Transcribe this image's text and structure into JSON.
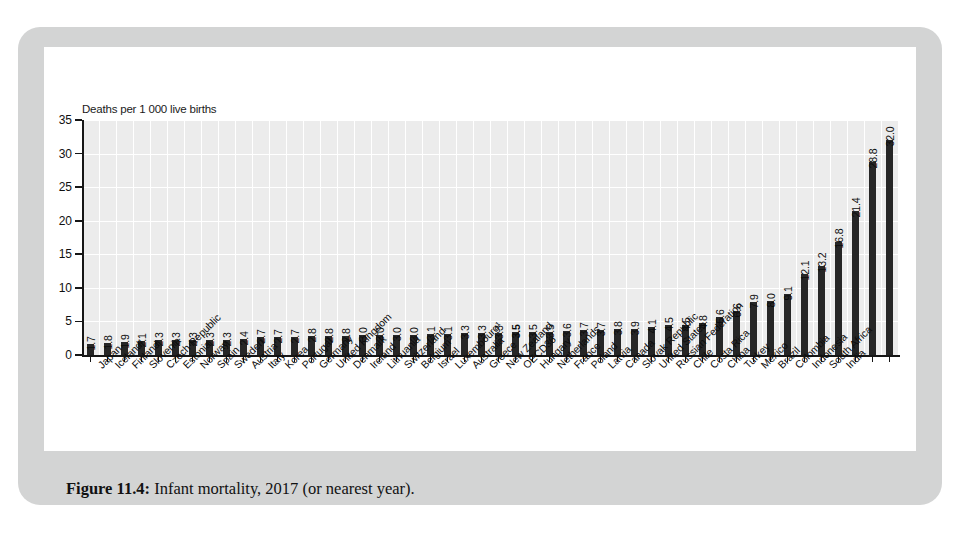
{
  "caption": {
    "label": "Figure 11.4:",
    "text": " Infant mortality, 2017 (or nearest year)."
  },
  "chart_data": {
    "type": "bar",
    "title": "Infant mortality, 2017 (or nearest year)",
    "ylabel": "Deaths per 1 000 live births",
    "xlabel": "",
    "ylim": [
      0,
      35
    ],
    "yticks": [
      0,
      5,
      10,
      15,
      20,
      25,
      30,
      35
    ],
    "grid": true,
    "legend": "none",
    "bar_color": "#262626",
    "plot_background": "#ececec",
    "highlight_category": "OECD36",
    "categories": [
      "Japan",
      "Iceland¹",
      "Finland",
      "Slovenia",
      "Czech Republic",
      "Estonia",
      "Norway",
      "Spain",
      "Sweden",
      "Austria",
      "Italy",
      "Korea",
      "Portugal",
      "Germany",
      "United Kingdom",
      "Denmark",
      "Ireland",
      "Lithuania",
      "Switzerland",
      "Belgium",
      "Israel",
      "Luxembourg¹",
      "Australia",
      "Greece",
      "New Zealand",
      "OECD36",
      "Hungary",
      "Netherlands",
      "France",
      "Poland",
      "Latvia",
      "Canada",
      "Slovak Republic",
      "United States",
      "Russian Federation",
      "Chile",
      "Costa Rica",
      "China",
      "Turkey",
      "Mexico",
      "Brazil",
      "Colombia",
      "Indonesia",
      "South Africa",
      "India"
    ],
    "values": [
      1.7,
      1.8,
      1.9,
      2.1,
      2.3,
      2.3,
      2.3,
      2.3,
      2.3,
      2.4,
      2.7,
      2.7,
      2.7,
      2.8,
      2.8,
      2.8,
      3.0,
      3.0,
      3.0,
      3.0,
      3.1,
      3.1,
      3.3,
      3.3,
      3.3,
      3.5,
      3.5,
      3.5,
      3.6,
      3.7,
      3.7,
      3.8,
      3.9,
      4.1,
      4.5,
      4.5,
      4.8,
      5.6,
      6.6,
      7.9,
      8.0,
      9.1,
      12.1,
      13.2,
      16.8
    ],
    "value_labels": [
      "1.7",
      "1.8",
      "1.9",
      "2.1",
      "2.3",
      "2.3",
      "2.3",
      "2.3",
      "2.3",
      "2.4",
      "2.7",
      "2.7",
      "2.7",
      "2.8",
      "2.8",
      "2.8",
      "3.0",
      "3.0",
      "3.0",
      "3.0",
      "3.1",
      "3.1",
      "3.3",
      "3.3",
      "3.3",
      "3.5",
      "3.5",
      "3.5",
      "3.6",
      "3.7",
      "3.7",
      "3.8",
      "3.9",
      "4.1",
      "4.5",
      "4.5",
      "4.8",
      "5.6",
      "6.6",
      "7.9",
      "8.0",
      "9.1",
      "12.1",
      "13.2",
      "16.8"
    ]
  },
  "chart_full": {
    "categories": [
      "Japan",
      "Iceland¹",
      "Finland",
      "Slovenia",
      "Czech Republic",
      "Estonia",
      "Norway",
      "Spain",
      "Sweden",
      "Austria",
      "Italy",
      "Korea",
      "Portugal",
      "Germany",
      "United Kingdom",
      "Denmark",
      "Ireland",
      "Lithuania",
      "Switzerland",
      "Belgium",
      "Israel",
      "Luxembourg¹",
      "Australia",
      "Greece",
      "New Zealand",
      "OECD36",
      "Hungary",
      "Netherlands",
      "France",
      "Poland",
      "Latvia",
      "Canada",
      "Slovak Republic",
      "United States",
      "Russian Federation",
      "Chile",
      "Costa Rica",
      "China",
      "Turkey",
      "Mexico",
      "Brazil",
      "Colombia",
      "Indonesia",
      "South Africa",
      "India"
    ],
    "values": [
      1.7,
      1.8,
      1.9,
      2.1,
      2.3,
      2.3,
      2.3,
      2.3,
      2.3,
      2.4,
      2.7,
      2.7,
      2.7,
      2.8,
      2.8,
      2.8,
      3.0,
      3.0,
      3.0,
      3.0,
      3.1,
      3.1,
      3.3,
      3.3,
      3.3,
      3.5,
      3.5,
      3.5,
      3.6,
      3.7,
      3.7,
      3.8,
      3.9,
      4.1,
      4.5,
      4.5,
      4.8,
      5.6,
      6.6,
      7.9,
      8.0,
      9.1,
      12.1,
      13.2,
      16.8,
      21.4,
      28.8,
      32.0
    ]
  },
  "axis": {
    "y_title": "Deaths per 1 000 live births",
    "y_tick_labels": [
      "35",
      "30",
      "25",
      "20",
      "15",
      "10",
      "5",
      "0"
    ]
  }
}
